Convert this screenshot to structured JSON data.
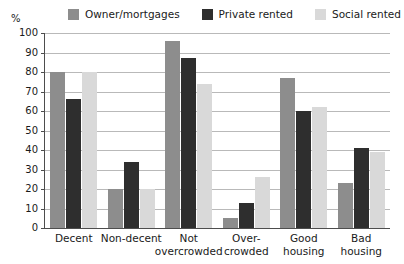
{
  "chart_data": {
    "type": "bar",
    "title": "",
    "subtitle": "",
    "xlabel": "",
    "ylabel": "%",
    "ylim": [
      0,
      100
    ],
    "yticks": [
      0,
      10,
      20,
      30,
      40,
      50,
      60,
      70,
      80,
      90,
      100
    ],
    "grid": true,
    "legend_position": "top",
    "categories": [
      "Decent",
      "Non-decent",
      "Not\novercrowded",
      "Over-\ncrowded",
      "Good\nhousing",
      "Bad\nhousing"
    ],
    "category_lines": [
      [
        "Decent",
        ""
      ],
      [
        "Non-decent",
        ""
      ],
      [
        "Not",
        "overcrowded"
      ],
      [
        "Over-",
        "crowded"
      ],
      [
        "Good",
        "housing"
      ],
      [
        "Bad",
        "housing"
      ]
    ],
    "series": [
      {
        "name": "Owner/mortgages",
        "color": "#8d8d8d",
        "values": [
          80,
          20,
          96,
          5,
          77,
          23
        ]
      },
      {
        "name": "Private rented",
        "color": "#2e2e2e",
        "values": [
          66,
          34,
          87,
          13,
          60,
          41
        ]
      },
      {
        "name": "Social rented",
        "color": "#d9d9d9",
        "values": [
          80,
          20,
          74,
          26,
          62,
          39
        ]
      }
    ]
  },
  "axis": {
    "unit_label": "%"
  }
}
